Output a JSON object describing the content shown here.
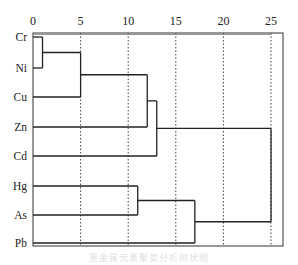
{
  "chart_data": {
    "type": "dendrogram",
    "title": "",
    "caption": "重金属元素聚类分析树状图",
    "xlabel": "",
    "ylabel": "",
    "orientation": "horizontal",
    "xlim": [
      0,
      25
    ],
    "x_ticks": [
      0,
      5,
      10,
      15,
      20,
      25
    ],
    "x_tick_labels": [
      "0",
      "5",
      "10",
      "15",
      "20",
      "25"
    ],
    "grid": {
      "vertical_dotted": [
        5,
        10,
        15,
        20,
        25
      ]
    },
    "leaves": [
      "Cr",
      "Ni",
      "Cu",
      "Zn",
      "Cd",
      "Hg",
      "As",
      "Pb"
    ],
    "merges": [
      {
        "members": [
          "Cr",
          "Ni"
        ],
        "distance": 1
      },
      {
        "members": [
          "Cr-Ni",
          "Cu"
        ],
        "distance": 5
      },
      {
        "members": [
          "Cr-Ni-Cu",
          "Zn"
        ],
        "distance": 12
      },
      {
        "members": [
          "Cr-Ni-Cu-Zn",
          "Cd"
        ],
        "distance": 13
      },
      {
        "members": [
          "Hg",
          "As"
        ],
        "distance": 11
      },
      {
        "members": [
          "Hg-As",
          "Pb"
        ],
        "distance": 17
      },
      {
        "members": [
          "Cr-Ni-Cu-Zn-Cd",
          "Hg-As-Pb"
        ],
        "distance": 25
      }
    ]
  },
  "geometry": {
    "x0_px": 33,
    "px_per_unit": 9.52,
    "axis_top_px": 33,
    "plot_bottom_px": 246,
    "plot_right_px": 283,
    "leaf_y_px": {
      "Cr": 37,
      "Ni": 68,
      "Cu": 97,
      "Zn": 127,
      "Cd": 156,
      "Hg": 186,
      "As": 215,
      "Pb": 243
    }
  }
}
